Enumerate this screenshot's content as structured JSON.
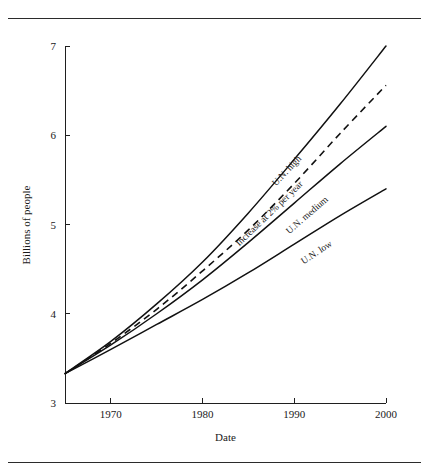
{
  "figure": {
    "kind": "line-chart",
    "has_top_rule": true,
    "has_bottom_rule": true
  },
  "chart_data": {
    "type": "line",
    "title": "",
    "subtitle": "",
    "xlabel": "Date",
    "ylabel": "Billions of people",
    "xlim": [
      1965,
      2000
    ],
    "ylim": [
      3,
      7
    ],
    "xticks": [
      1970,
      1980,
      1990,
      2000
    ],
    "xticklabels": [
      "1970",
      "1980",
      "1990",
      "2000"
    ],
    "yticks": [
      3,
      4,
      5,
      6,
      7
    ],
    "yticklabels": [
      "3",
      "4",
      "5",
      "6",
      "7"
    ],
    "grid": false,
    "legend": "inline-curve-labels",
    "x": [
      1965,
      1970,
      1975,
      1980,
      1985,
      1990,
      1995,
      2000
    ],
    "series": [
      {
        "name": "U.N. high",
        "label": "U.N. high",
        "style": "solid",
        "color": "#111111",
        "values": [
          3.33,
          3.69,
          4.11,
          4.58,
          5.13,
          5.73,
          6.35,
          7.0
        ],
        "label_angle_deg": -47,
        "label_x": 1989.4,
        "label_y": 5.58
      },
      {
        "name": "Increase at 2% per year",
        "label": "Increase at 2% per year",
        "style": "dashed",
        "color": "#111111",
        "values": [
          3.33,
          3.67,
          4.05,
          4.48,
          4.94,
          5.46,
          6.02,
          6.56
        ],
        "label_angle_deg": -44,
        "label_x": 1987.5,
        "label_y": 5.1
      },
      {
        "name": "U.N. medium",
        "label": "U.N. medium",
        "style": "solid",
        "color": "#111111",
        "values": [
          3.33,
          3.65,
          4.0,
          4.38,
          4.8,
          5.24,
          5.68,
          6.1
        ],
        "label_angle_deg": -41,
        "label_x": 1991.6,
        "label_y": 5.08
      },
      {
        "name": "U.N. low",
        "label": "U.N. low",
        "style": "solid",
        "color": "#111111",
        "values": [
          3.33,
          3.6,
          3.88,
          4.16,
          4.46,
          4.78,
          5.1,
          5.4
        ],
        "label_angle_deg": -33,
        "label_x": 1992.6,
        "label_y": 4.66
      }
    ]
  }
}
